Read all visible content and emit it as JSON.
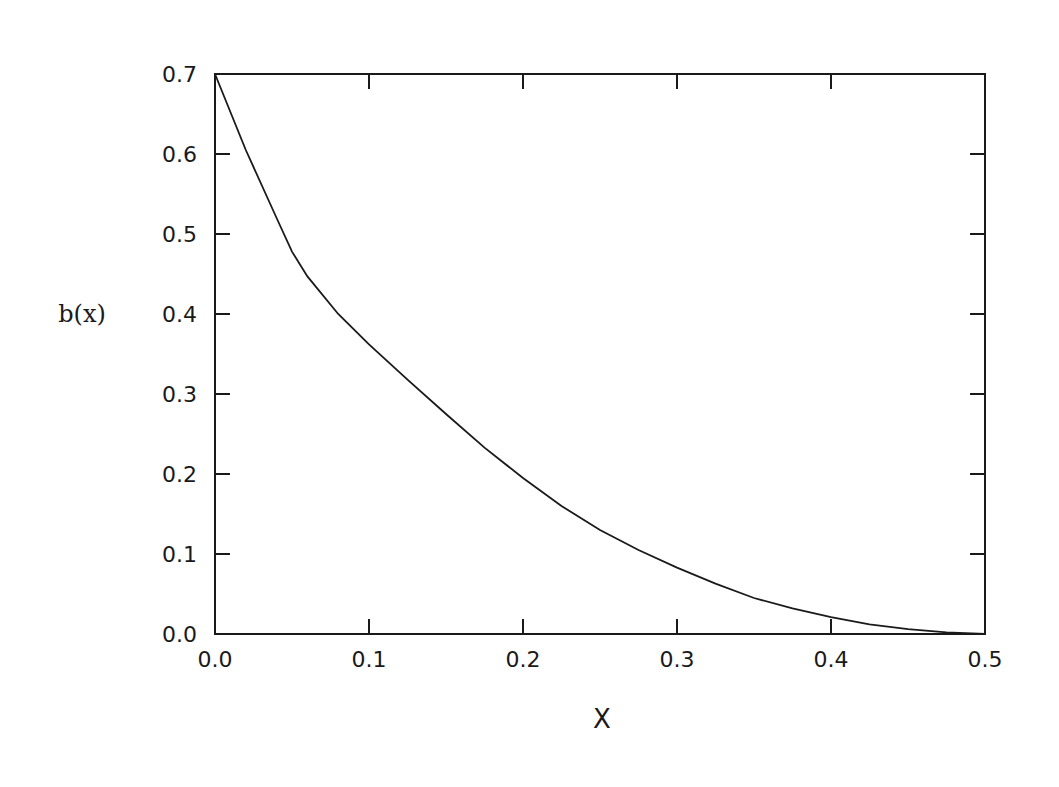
{
  "chart_data": {
    "type": "line",
    "title": "",
    "xlabel": "X",
    "ylabel": "b(x)",
    "xlim": [
      0.0,
      0.5
    ],
    "ylim": [
      0.0,
      0.7
    ],
    "grid": false,
    "legend": null,
    "x_ticks": [
      "0.0",
      "0.1",
      "0.2",
      "0.3",
      "0.4",
      "0.5"
    ],
    "y_ticks": [
      "0.0",
      "0.1",
      "0.2",
      "0.3",
      "0.4",
      "0.5",
      "0.6",
      "0.7"
    ],
    "series": [
      {
        "name": "b(x)",
        "color": "#1a1a1a",
        "x": [
          0.0,
          0.02,
          0.04,
          0.05,
          0.06,
          0.08,
          0.1,
          0.125,
          0.15,
          0.175,
          0.2,
          0.225,
          0.25,
          0.275,
          0.3,
          0.325,
          0.35,
          0.375,
          0.4,
          0.425,
          0.45,
          0.475,
          0.5
        ],
        "y": [
          0.7,
          0.605,
          0.52,
          0.478,
          0.447,
          0.4,
          0.362,
          0.318,
          0.275,
          0.233,
          0.195,
          0.16,
          0.13,
          0.105,
          0.083,
          0.063,
          0.045,
          0.032,
          0.021,
          0.012,
          0.006,
          0.002,
          0.0
        ]
      }
    ]
  },
  "labels": {
    "ylabel": "b(x)",
    "xlabel": "X"
  }
}
